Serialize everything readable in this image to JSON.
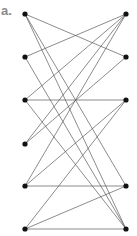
{
  "figure": {
    "panel_label": "a.",
    "colors": {
      "node": "#111111",
      "edge": "#5a5a5a",
      "label": "#8a8a8a",
      "background": "#ffffff"
    },
    "graph_type": "bipartite",
    "left_nodes": [
      {
        "id": "L1",
        "x": 25,
        "y": 14
      },
      {
        "id": "L2",
        "x": 25,
        "y": 57
      },
      {
        "id": "L3",
        "x": 25,
        "y": 100
      },
      {
        "id": "L4",
        "x": 25,
        "y": 144
      },
      {
        "id": "L5",
        "x": 25,
        "y": 186
      },
      {
        "id": "L6",
        "x": 25,
        "y": 229
      }
    ],
    "right_nodes": [
      {
        "id": "R1",
        "x": 126,
        "y": 14
      },
      {
        "id": "R2",
        "x": 126,
        "y": 57
      },
      {
        "id": "R3",
        "x": 126,
        "y": 100
      },
      {
        "id": "R5",
        "x": 126,
        "y": 186
      },
      {
        "id": "R6",
        "x": 126,
        "y": 229
      }
    ],
    "edges": [
      [
        "L1",
        "R2"
      ],
      [
        "L1",
        "R5"
      ],
      [
        "L1",
        "R6"
      ],
      [
        "R1",
        "L2"
      ],
      [
        "R1",
        "L3"
      ],
      [
        "R1",
        "L4"
      ],
      [
        "R1",
        "L5"
      ],
      [
        "L2",
        "R6"
      ],
      [
        "L3",
        "R3"
      ],
      [
        "L3",
        "R6"
      ],
      [
        "R2",
        "L4"
      ],
      [
        "R3",
        "L5"
      ],
      [
        "R3",
        "L6"
      ],
      [
        "L5",
        "R5"
      ],
      [
        "L6",
        "R5"
      ],
      [
        "L6",
        "R6"
      ]
    ]
  }
}
